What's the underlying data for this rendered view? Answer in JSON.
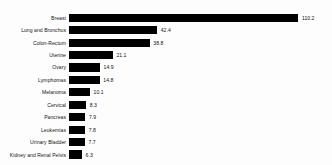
{
  "chart_data": {
    "type": "bar",
    "orientation": "horizontal",
    "title": "",
    "subtitle": "",
    "xlabel": "",
    "ylabel": "",
    "grid": false,
    "legend": null,
    "axis_visible": false,
    "value_labels": true,
    "xlim": [
      0,
      110.2
    ],
    "categories": [
      "Breast",
      "Lung and Bronchus",
      "Colon-Rectum",
      "Uterine",
      "Ovary",
      "Lymphomas",
      "Melanoma",
      "Cervical",
      "Pancreas",
      "Leukemias",
      "Urinary Bladder",
      "Kidney and Renal Pelvis"
    ],
    "values": [
      110.2,
      42.4,
      38.8,
      21.1,
      14.9,
      14.8,
      10.1,
      8.3,
      7.9,
      7.8,
      7.7,
      6.3
    ],
    "value_text": [
      "110.2",
      "42.4",
      "38.8",
      "21.1",
      "14.9",
      "14.8",
      "10.1",
      "8.3",
      "7.9",
      "7.8",
      "7.7",
      "6.3"
    ],
    "bar_color": "#000000",
    "background_color": "#fdfdfd",
    "text_color": "#141414"
  }
}
